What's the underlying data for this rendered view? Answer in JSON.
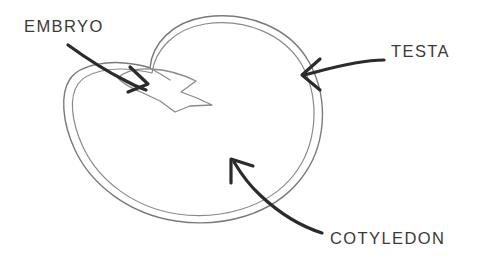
{
  "diagram": {
    "background_color": "#ffffff",
    "outline_color": "#7a7a7a",
    "leader_color": "#2b2b2b",
    "text_color": "#3a3a3a"
  },
  "labels": {
    "embryo": "EMBRYO",
    "testa": "TESTA",
    "cotyledon": "COTYLEDON"
  },
  "parts": [
    {
      "id": "embryo",
      "name": "EMBRYO",
      "icon": "embryo-shape-icon",
      "label_position": "top-left",
      "pointer_target": "upper-left interior of seed"
    },
    {
      "id": "testa",
      "name": "TESTA",
      "icon": "seed-coat-icon",
      "label_position": "right",
      "pointer_target": "right outer double line of seed coat"
    },
    {
      "id": "cotyledon",
      "name": "COTYLEDON",
      "icon": "cotyledon-body-icon",
      "label_position": "bottom-right",
      "pointer_target": "lower-right body of seed"
    }
  ]
}
